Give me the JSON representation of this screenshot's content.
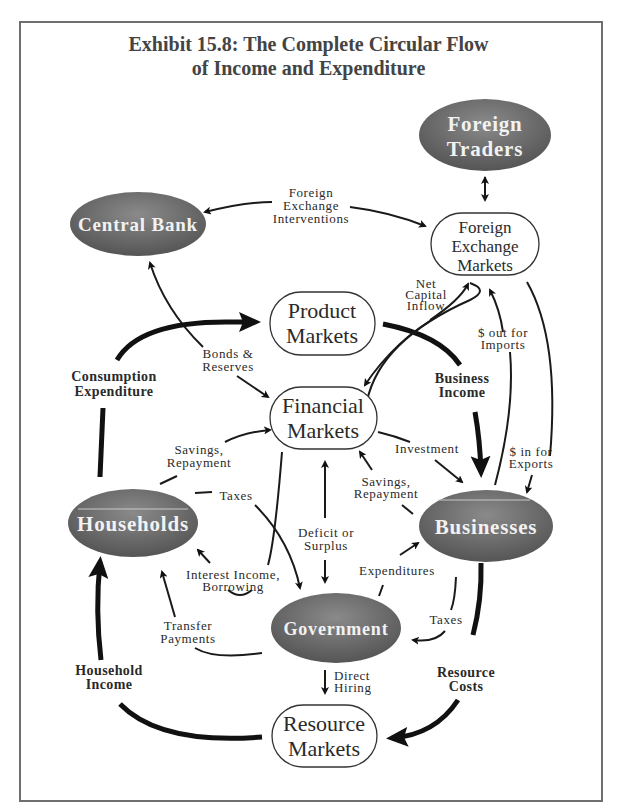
{
  "title": {
    "line1": "Exhibit 15.8: The Complete Circular Flow",
    "line2": "of Income and Expenditure"
  },
  "nodes": {
    "foreign_traders": [
      "Foreign",
      "Traders"
    ],
    "central_bank": "Central Bank",
    "foreign_exchange_markets": [
      "Foreign",
      "Exchange",
      "Markets"
    ],
    "product_markets": [
      "Product",
      "Markets"
    ],
    "financial_markets": [
      "Financial",
      "Markets"
    ],
    "households": "Households",
    "businesses": "Businesses",
    "government": "Government",
    "resource_markets": [
      "Resource",
      "Markets"
    ]
  },
  "flows": {
    "foreign_exchange_interventions": [
      "Foreign",
      "Exchange",
      "Interventions"
    ],
    "net_capital_inflow": [
      "Net",
      "Capital",
      "Inflow"
    ],
    "bonds_reserves": [
      "Bonds &",
      "Reserves"
    ],
    "consumption_expenditure": [
      "Consumption",
      "Expenditure"
    ],
    "business_income": [
      "Business",
      "Income"
    ],
    "out_for_imports": [
      "$ out for",
      "Imports"
    ],
    "in_for_exports": [
      "$ in for",
      "Exports"
    ],
    "investment": "Investment",
    "savings_repayment_households": [
      "Savings,",
      "Repayment"
    ],
    "savings_repayment_businesses": [
      "Savings,",
      "Repayment"
    ],
    "taxes_households": "Taxes",
    "deficit_or_surplus": [
      "Deficit or",
      "Surplus"
    ],
    "interest_income_borrowing": [
      "Interest Income,",
      "Borrowing"
    ],
    "expenditures": "Expenditures",
    "taxes_businesses": "Taxes",
    "transfer_payments": [
      "Transfer",
      "Payments"
    ],
    "household_income": [
      "Household",
      "Income"
    ],
    "direct_hiring": [
      "Direct",
      "Hiring"
    ],
    "resource_costs": [
      "Resource",
      "Costs"
    ]
  },
  "colors": {
    "oval_dark": "#5e5e5e",
    "oval_light": "#9a9a9a",
    "frame": "#6f6f6f",
    "text": "#2a2a2a"
  }
}
